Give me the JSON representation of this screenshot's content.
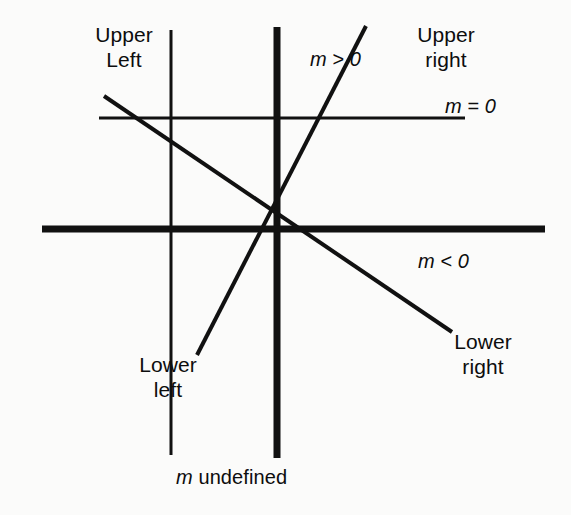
{
  "figure": {
    "background_color": "#fbfbfa",
    "ink_color": "#111111",
    "labels": {
      "upper_left": "Upper\nLeft",
      "upper_right": "Upper\nright",
      "lower_left": "Lower\nleft",
      "lower_right": "Lower\nright",
      "m_positive": "m > 0",
      "m_zero": "m = 0",
      "m_negative": "m < 0",
      "m_undefined": "m undefined"
    },
    "math_parts": {
      "m_positive": {
        "var": "m",
        "op": " > ",
        "num": "0"
      },
      "m_zero": {
        "var": "m",
        "op": " = ",
        "num": "0"
      },
      "m_negative": {
        "var": "m",
        "op": " < ",
        "num": "0"
      },
      "m_undefined": {
        "var": "m",
        "word": " undefined"
      }
    }
  },
  "chart_data": {
    "type": "line",
    "xlabel": "",
    "ylabel": "",
    "grid": false,
    "legend": "none",
    "xlim": [
      0,
      571
    ],
    "ylim": [
      515,
      0
    ],
    "note": "Pixel coordinates, y measured downward from top of image.",
    "series": [
      {
        "name": "thin-vertical-guide",
        "label": "",
        "stroke_width": 3,
        "points": [
          [
            171,
            30
          ],
          [
            171,
            455
          ]
        ]
      },
      {
        "name": "thick-vertical-axis",
        "label": "m undefined",
        "stroke_width": 7,
        "points": [
          [
            277,
            27
          ],
          [
            277,
            458
          ]
        ]
      },
      {
        "name": "thick-horizontal-axis",
        "label": "",
        "stroke_width": 7,
        "points": [
          [
            42,
            229
          ],
          [
            545,
            229
          ]
        ]
      },
      {
        "name": "thin-horizontal-line",
        "label": "m = 0",
        "stroke_width": 3,
        "points": [
          [
            99,
            118
          ],
          [
            465,
            118
          ]
        ]
      },
      {
        "name": "positive-slope-line",
        "label": "m > 0",
        "stroke_width": 4,
        "points": [
          [
            197,
            355
          ],
          [
            366,
            26
          ]
        ]
      },
      {
        "name": "negative-slope-line",
        "label": "m < 0",
        "stroke_width": 4,
        "points": [
          [
            104,
            96
          ],
          [
            452,
            332
          ]
        ]
      }
    ],
    "annotations": [
      {
        "text": "Upper Left",
        "x": 124,
        "y": 40
      },
      {
        "text": "Upper right",
        "x": 446,
        "y": 40
      },
      {
        "text": "m > 0",
        "x": 338,
        "y": 58
      },
      {
        "text": "m = 0",
        "x": 473,
        "y": 105
      },
      {
        "text": "m < 0",
        "x": 446,
        "y": 260
      },
      {
        "text": "Lower right",
        "x": 483,
        "y": 347
      },
      {
        "text": "Lower left",
        "x": 168,
        "y": 370
      },
      {
        "text": "m undefined",
        "x": 235,
        "y": 476
      }
    ]
  }
}
